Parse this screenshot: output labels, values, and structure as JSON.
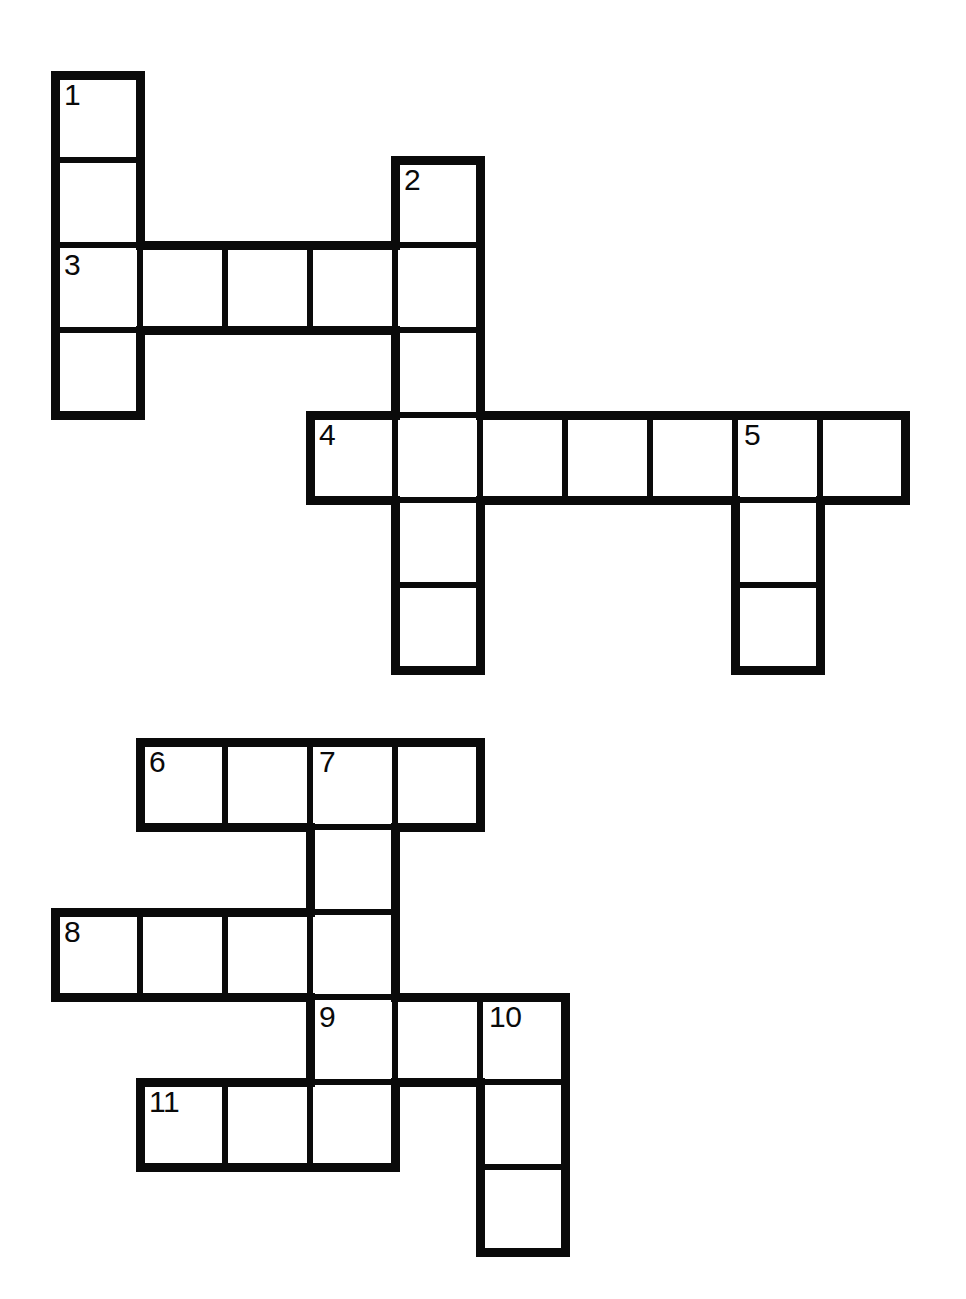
{
  "page": {
    "background_color": "#ffffff",
    "ink_color": "#0a0a0a",
    "width": 966,
    "height": 1299
  },
  "puzzle": {
    "cell_size": 85,
    "thin_line_width": 3,
    "thick_line_width": 9,
    "letters_filled": false,
    "total_clue_numbers": 11
  },
  "grids": [
    {
      "name": "upper-grid",
      "origin_x": 55,
      "origin_y": 75,
      "cells": [
        {
          "id": "u-c0-r0",
          "col": 0,
          "row": 0,
          "number": "1",
          "letter": ""
        },
        {
          "id": "u-c0-r1",
          "col": 0,
          "row": 1,
          "number": "",
          "letter": ""
        },
        {
          "id": "u-c0-r2",
          "col": 0,
          "row": 2,
          "number": "3",
          "letter": ""
        },
        {
          "id": "u-c0-r3",
          "col": 0,
          "row": 3,
          "number": "",
          "letter": ""
        },
        {
          "id": "u-c1-r2",
          "col": 1,
          "row": 2,
          "number": "",
          "letter": ""
        },
        {
          "id": "u-c2-r2",
          "col": 2,
          "row": 2,
          "number": "",
          "letter": ""
        },
        {
          "id": "u-c3-r2",
          "col": 3,
          "row": 2,
          "number": "",
          "letter": ""
        },
        {
          "id": "u-c4-r1",
          "col": 4,
          "row": 1,
          "number": "2",
          "letter": ""
        },
        {
          "id": "u-c4-r2",
          "col": 4,
          "row": 2,
          "number": "",
          "letter": ""
        },
        {
          "id": "u-c4-r3",
          "col": 4,
          "row": 3,
          "number": "",
          "letter": ""
        },
        {
          "id": "u-c4-r4",
          "col": 4,
          "row": 4,
          "number": "",
          "letter": ""
        },
        {
          "id": "u-c4-r5",
          "col": 4,
          "row": 5,
          "number": "",
          "letter": ""
        },
        {
          "id": "u-c4-r6",
          "col": 4,
          "row": 6,
          "number": "",
          "letter": ""
        },
        {
          "id": "u-c3-r4",
          "col": 3,
          "row": 4,
          "number": "4",
          "letter": ""
        },
        {
          "id": "u-c5-r4",
          "col": 5,
          "row": 4,
          "number": "",
          "letter": ""
        },
        {
          "id": "u-c6-r4",
          "col": 6,
          "row": 4,
          "number": "",
          "letter": ""
        },
        {
          "id": "u-c7-r4",
          "col": 7,
          "row": 4,
          "number": "",
          "letter": ""
        },
        {
          "id": "u-c8-r4",
          "col": 8,
          "row": 4,
          "number": "5",
          "letter": ""
        },
        {
          "id": "u-c9-r4",
          "col": 9,
          "row": 4,
          "number": "",
          "letter": ""
        },
        {
          "id": "u-c8-r5",
          "col": 8,
          "row": 5,
          "number": "",
          "letter": ""
        },
        {
          "id": "u-c8-r6",
          "col": 8,
          "row": 6,
          "number": "",
          "letter": ""
        }
      ]
    },
    {
      "name": "lower-grid",
      "origin_x": 55,
      "origin_y": 742,
      "cells": [
        {
          "id": "l-c1-r0",
          "col": 1,
          "row": 0,
          "number": "6",
          "letter": ""
        },
        {
          "id": "l-c2-r0",
          "col": 2,
          "row": 0,
          "number": "",
          "letter": ""
        },
        {
          "id": "l-c3-r0",
          "col": 3,
          "row": 0,
          "number": "7",
          "letter": ""
        },
        {
          "id": "l-c4-r0",
          "col": 4,
          "row": 0,
          "number": "",
          "letter": ""
        },
        {
          "id": "l-c3-r1",
          "col": 3,
          "row": 1,
          "number": "",
          "letter": ""
        },
        {
          "id": "l-c0-r2",
          "col": 0,
          "row": 2,
          "number": "8",
          "letter": ""
        },
        {
          "id": "l-c1-r2",
          "col": 1,
          "row": 2,
          "number": "",
          "letter": ""
        },
        {
          "id": "l-c2-r2",
          "col": 2,
          "row": 2,
          "number": "",
          "letter": ""
        },
        {
          "id": "l-c3-r2",
          "col": 3,
          "row": 2,
          "number": "",
          "letter": ""
        },
        {
          "id": "l-c3-r3",
          "col": 3,
          "row": 3,
          "number": "9",
          "letter": ""
        },
        {
          "id": "l-c4-r3",
          "col": 4,
          "row": 3,
          "number": "",
          "letter": ""
        },
        {
          "id": "l-c5-r3",
          "col": 5,
          "row": 3,
          "number": "10",
          "letter": ""
        },
        {
          "id": "l-c1-r4",
          "col": 1,
          "row": 4,
          "number": "11",
          "letter": ""
        },
        {
          "id": "l-c2-r4",
          "col": 2,
          "row": 4,
          "number": "",
          "letter": ""
        },
        {
          "id": "l-c3-r4",
          "col": 3,
          "row": 4,
          "number": "",
          "letter": ""
        },
        {
          "id": "l-c5-r4",
          "col": 5,
          "row": 4,
          "number": "",
          "letter": ""
        },
        {
          "id": "l-c5-r5",
          "col": 5,
          "row": 5,
          "number": "",
          "letter": ""
        }
      ]
    }
  ],
  "entries": {
    "across": [
      {
        "number": "3",
        "length": 5,
        "grid": "upper-grid",
        "start_col": 0,
        "row": 2
      },
      {
        "number": "4",
        "length": 7,
        "grid": "upper-grid",
        "start_col": 3,
        "row": 4
      },
      {
        "number": "6",
        "length": 4,
        "grid": "lower-grid",
        "start_col": 1,
        "row": 0
      },
      {
        "number": "8",
        "length": 4,
        "grid": "lower-grid",
        "start_col": 0,
        "row": 2
      },
      {
        "number": "9",
        "length": 3,
        "grid": "lower-grid",
        "start_col": 3,
        "row": 3
      },
      {
        "number": "11",
        "length": 3,
        "grid": "lower-grid",
        "start_col": 1,
        "row": 4
      }
    ],
    "down": [
      {
        "number": "1",
        "length": 4,
        "grid": "upper-grid",
        "col": 0,
        "start_row": 0
      },
      {
        "number": "2",
        "length": 6,
        "grid": "upper-grid",
        "col": 4,
        "start_row": 1
      },
      {
        "number": "5",
        "length": 3,
        "grid": "upper-grid",
        "col": 8,
        "start_row": 4
      },
      {
        "number": "7",
        "length": 5,
        "grid": "lower-grid",
        "col": 3,
        "start_row": 0
      },
      {
        "number": "10",
        "length": 3,
        "grid": "lower-grid",
        "col": 5,
        "start_row": 3
      }
    ]
  }
}
